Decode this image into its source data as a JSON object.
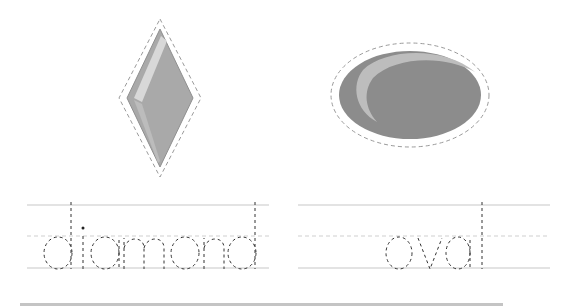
{
  "worksheet": {
    "items": [
      {
        "word": "diamond",
        "shape": "diamond",
        "shape_color": "#a9a9a9",
        "highlight_color": "#d8d8d8",
        "outline_style": "dashed"
      },
      {
        "word": "oval",
        "shape": "oval",
        "shape_color": "#8c8c8c",
        "highlight_color": "#bdbdbd",
        "outline_style": "dashed"
      }
    ],
    "guide_lines": {
      "solid_color": "#c8c8c8",
      "dashed_color": "#cfcfcf",
      "trace_color": "#333333"
    }
  }
}
